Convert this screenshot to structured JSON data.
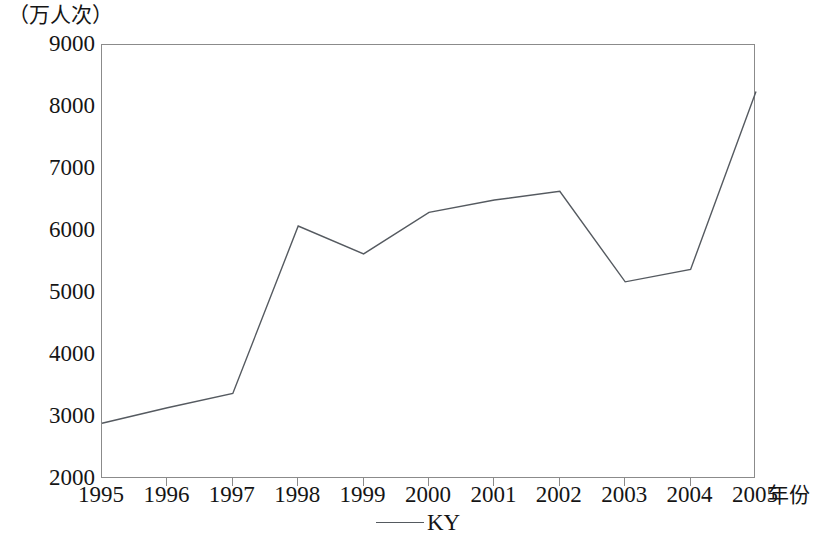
{
  "axes": {
    "y_unit_caption": "（万人次）",
    "x_axis_title": "年份",
    "y_ticks": [
      "9000",
      "8000",
      "7000",
      "6000",
      "5000",
      "4000",
      "3000",
      "2000"
    ],
    "x_ticks": [
      "1995",
      "1996",
      "1997",
      "1998",
      "1999",
      "2000",
      "2001",
      "2002",
      "2003",
      "2004",
      "2005"
    ]
  },
  "legend": {
    "entries": [
      {
        "label": "KY",
        "color": "#555a60"
      }
    ]
  },
  "style": {
    "line_color": "#555a60",
    "frame_color": "#8b8b8b",
    "background": "#ffffff"
  },
  "chart_data": {
    "type": "line",
    "title": "",
    "subtitle": "",
    "xlabel": "年份",
    "ylabel": "（万人次）",
    "x": [
      1995,
      1996,
      1997,
      1998,
      1999,
      2000,
      2001,
      2002,
      2003,
      2004,
      2005
    ],
    "categories": [
      "1995",
      "1996",
      "1997",
      "1998",
      "1999",
      "2000",
      "2001",
      "2002",
      "2003",
      "2004",
      "2005"
    ],
    "series": [
      {
        "name": "KY",
        "color": "#555a60",
        "values": [
          2900,
          3150,
          3380,
          6080,
          5630,
          6300,
          6500,
          6640,
          5180,
          5380,
          8250
        ]
      }
    ],
    "xlim": [
      1995,
      2005
    ],
    "ylim": [
      2000,
      9000
    ],
    "ytick_step": 1000,
    "grid": false,
    "legend_position": "bottom-center",
    "markers": false
  }
}
